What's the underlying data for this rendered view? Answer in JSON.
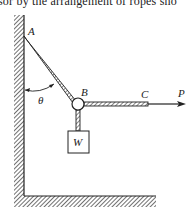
{
  "caption": {
    "text": "sor by the arrangement of ropes sho"
  },
  "diagram": {
    "labels": {
      "A": "A",
      "B": "B",
      "C": "C",
      "P": "P",
      "W": "W",
      "theta": "θ"
    },
    "elements": {
      "wall": "vertical hatched wall",
      "floor": "horizontal hatched floor",
      "rope_AB": "inclined rope from wall point A to ring B",
      "rope_BC": "horizontal rope from B to C",
      "force_P": "arrow at C pointing right",
      "weight_W": "block hanging from B",
      "angle_theta": "angle between wall and rope AB"
    },
    "colors": {
      "ink": "#222222",
      "background": "#ffffff"
    }
  }
}
